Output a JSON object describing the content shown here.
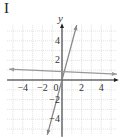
{
  "figure": {
    "label": "I"
  },
  "chart_data": {
    "type": "line",
    "title": "I",
    "xlabel": "",
    "ylabel": "y",
    "xlim": [
      -5.6,
      5.6
    ],
    "ylim": [
      -5.6,
      5.6
    ],
    "grid": true,
    "x_ticks": [
      "-4",
      "-2",
      "0",
      "2",
      "4"
    ],
    "y_ticks": [
      "4",
      "2",
      "-2",
      "-4"
    ],
    "series": [
      {
        "name": "steep line",
        "points": [
          [
            -1.5,
            -5.6
          ],
          [
            1.5,
            5.6
          ]
        ],
        "slope": 3.7,
        "intercept": 0.7,
        "color": "#888888"
      },
      {
        "name": "near-horizontal line",
        "points": [
          [
            -5.4,
            1.1
          ],
          [
            5.6,
            0.6
          ]
        ],
        "slope": -0.05,
        "intercept": 0.8,
        "color": "#999999"
      }
    ],
    "colors": {
      "axis": "#222222",
      "grid": "#cccccc",
      "lines": "#8a8a8a"
    }
  }
}
